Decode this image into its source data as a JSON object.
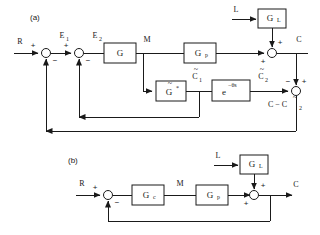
{
  "figure": {
    "type": "control-block-diagram",
    "background_color": "#ffffff",
    "line_color": "#1a1a1a",
    "panels": [
      {
        "id": "a",
        "label": "(a)",
        "description": "Smith predictor / internal model control structure with dead-time compensation",
        "blocks": [
          {
            "name": "G",
            "label": "G"
          },
          {
            "name": "Gp",
            "label": "G",
            "subscript": "p"
          },
          {
            "name": "GL",
            "label": "G",
            "subscript": "L"
          },
          {
            "name": "Gstar",
            "label": "G",
            "accent": "tilde",
            "superscript": "*"
          },
          {
            "name": "delay",
            "label": "e",
            "exponent": "−θs"
          }
        ],
        "signals": [
          {
            "name": "R",
            "label": "R"
          },
          {
            "name": "E1",
            "label": "E",
            "subscript": "1"
          },
          {
            "name": "E2",
            "label": "E",
            "subscript": "2"
          },
          {
            "name": "M",
            "label": "M"
          },
          {
            "name": "L",
            "label": "L"
          },
          {
            "name": "C",
            "label": "C"
          },
          {
            "name": "C1tilde",
            "label": "C",
            "accent": "tilde",
            "subscript": "1"
          },
          {
            "name": "C2tilde",
            "label": "C",
            "accent": "tilde",
            "subscript": "2"
          },
          {
            "name": "CminusC2",
            "label": "C − C",
            "accent": "tilde",
            "subscript": "2"
          }
        ],
        "signs": {
          "sum1_input": "+",
          "sum1_feedback": "−",
          "sum2_input": "+",
          "sum2_feedback": "−",
          "sum_output_top": "+",
          "sum_output_left": "+",
          "sum_model_left": "−",
          "sum_model_top": "+"
        }
      },
      {
        "id": "b",
        "label": "(b)",
        "description": "Conventional single-loop feedback control with load disturbance",
        "blocks": [
          {
            "name": "Gc",
            "label": "G",
            "subscript": "c"
          },
          {
            "name": "Gp",
            "label": "G",
            "subscript": "p"
          },
          {
            "name": "GL",
            "label": "G",
            "subscript": "L"
          }
        ],
        "signals": [
          {
            "name": "R",
            "label": "R"
          },
          {
            "name": "M",
            "label": "M"
          },
          {
            "name": "L",
            "label": "L"
          },
          {
            "name": "C",
            "label": "C"
          }
        ],
        "signs": {
          "sum1_input": "+",
          "sum1_feedback": "−",
          "sum2_top": "+",
          "sum2_left": "+"
        }
      }
    ]
  }
}
